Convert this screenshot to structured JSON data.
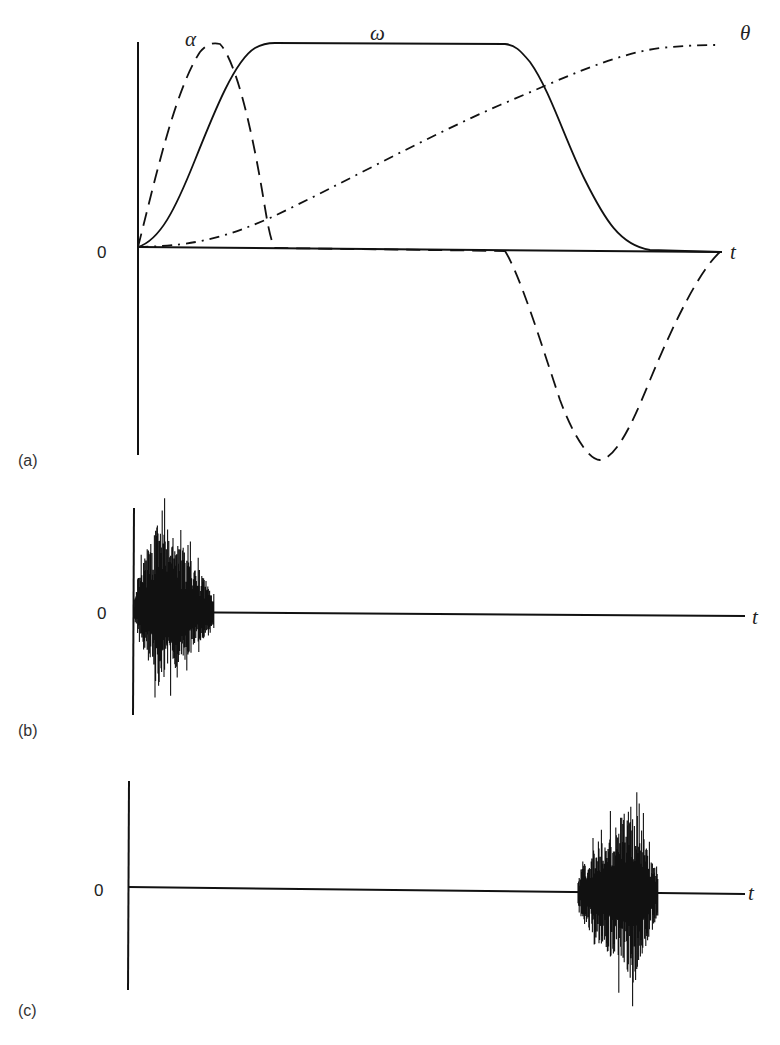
{
  "figure": {
    "panels": [
      {
        "id": "a",
        "panel_label": "(a)",
        "zero_label": "0",
        "time_label": "t",
        "curve_labels": {
          "alpha": "α",
          "omega": "ω",
          "theta": "θ"
        }
      },
      {
        "id": "b",
        "panel_label": "(b)",
        "zero_label": "0",
        "time_label": "t"
      },
      {
        "id": "c",
        "panel_label": "(c)",
        "zero_label": "0",
        "time_label": "t"
      }
    ]
  },
  "chart_data": [
    {
      "type": "line",
      "panel": "(a)",
      "title": "",
      "xlabel": "t",
      "ylabel": "",
      "x_range": [
        0,
        1
      ],
      "grid": false,
      "legend": "inline curve labels",
      "series": [
        {
          "name": "α",
          "style": "dashed",
          "description": "positive sine-like lobe at start (peak ~t=0.13), zero during coast, negative lobe at end (min ~t=0.87)",
          "x": [
            0,
            0.06,
            0.13,
            0.2,
            0.22,
            0.64,
            0.66,
            0.75,
            0.87,
            0.95,
            1.0
          ],
          "y": [
            0,
            0.75,
            1.0,
            0.45,
            0,
            0,
            0,
            -0.55,
            -1.05,
            -0.6,
            0
          ]
        },
        {
          "name": "ω",
          "style": "solid",
          "description": "S-shaped rise to plateau, constant, S-shaped decay to zero",
          "x": [
            0,
            0.1,
            0.2,
            0.22,
            0.5,
            0.64,
            0.78,
            0.9,
            1.0
          ],
          "y": [
            0,
            0.45,
            0.95,
            1.0,
            1.0,
            1.0,
            0.75,
            0.25,
            0
          ]
        },
        {
          "name": "θ",
          "style": "dash-dot",
          "description": "smooth S-curve monotonic increase from 0 to max",
          "x": [
            0,
            0.2,
            0.4,
            0.6,
            0.8,
            1.0
          ],
          "y": [
            0,
            0.1,
            0.35,
            0.65,
            0.9,
            1.0
          ]
        }
      ]
    },
    {
      "type": "line",
      "panel": "(b)",
      "title": "",
      "xlabel": "t",
      "ylabel": "",
      "grid": false,
      "description": "oscillatory vibration/noise burst at the start of motion (t≈0–0.13), then flat zero",
      "burst_x_range": [
        0,
        0.13
      ],
      "burst_peak_x": 0.06
    },
    {
      "type": "line",
      "panel": "(c)",
      "title": "",
      "xlabel": "t",
      "ylabel": "",
      "grid": false,
      "description": "flat zero until near the end, then oscillatory vibration/noise burst (t≈0.72–0.86)",
      "burst_x_range": [
        0.72,
        0.86
      ],
      "burst_peak_x": 0.81
    }
  ]
}
